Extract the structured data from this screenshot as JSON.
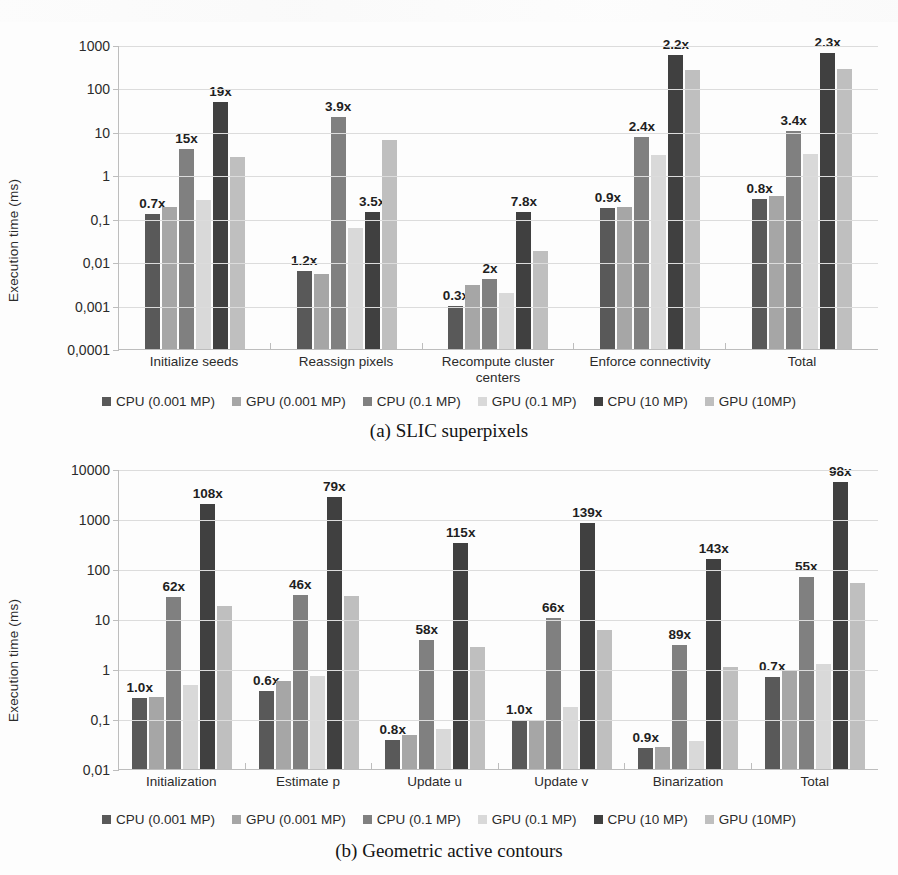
{
  "figures": [
    {
      "id": "fig-a",
      "caption": "(a) SLIC superpixels",
      "chart_data": {
        "type": "bar",
        "title": "",
        "xlabel": "",
        "ylabel": "Execution time (ms)",
        "yscale": "log",
        "ylim": [
          0.0001,
          1000
        ],
        "ytick_labels": [
          "1000",
          "100",
          "10",
          "1",
          "0,1",
          "0,01",
          "0,001",
          "0,0001"
        ],
        "ytick_values": [
          1000,
          100,
          10,
          1,
          0.1,
          0.01,
          0.001,
          0.0001
        ],
        "grid": true,
        "legend_position": "bottom",
        "categories": [
          "Initialize seeds",
          "Reassign pixels",
          "Recompute cluster centers",
          "Enforce connectivity",
          "Total"
        ],
        "series": [
          {
            "name": "CPU (0.001 MP)",
            "color": "#595959",
            "values": [
              0.13,
              0.0063,
              0.001,
              0.18,
              0.28
            ]
          },
          {
            "name": "GPU (0.001 MP)",
            "color": "#a6a6a6",
            "values": [
              0.19,
              0.0053,
              0.003,
              0.19,
              0.33
            ]
          },
          {
            "name": "CPU (0.1 MP)",
            "color": "#808080",
            "values": [
              4.0,
              22.0,
              0.004,
              7.5,
              10.5
            ]
          },
          {
            "name": "GPU (0.1 MP)",
            "color": "#d9d9d9",
            "values": [
              0.27,
              0.062,
              0.002,
              3.0,
              3.1
            ]
          },
          {
            "name": "CPU (10 MP)",
            "color": "#404040",
            "values": [
              48.0,
              0.14,
              0.14,
              600.0,
              640.0
            ]
          },
          {
            "name": "GPU (10MP)",
            "color": "#bfbfbf",
            "values": [
              2.6,
              6.5,
              0.018,
              270.0,
              280.0
            ]
          }
        ],
        "annotations": [
          {
            "category": "Initialize seeds",
            "labels": [
              {
                "text": "0.7x",
                "series": "CPU (0.001 MP)"
              },
              {
                "text": "15x",
                "series": "CPU (0.1 MP)"
              },
              {
                "text": "19x",
                "series": "CPU (10 MP)"
              }
            ]
          },
          {
            "category": "Reassign pixels",
            "labels": [
              {
                "text": "1.2x",
                "series": "CPU (0.001 MP)"
              },
              {
                "text": "3.9x",
                "series": "CPU (0.1 MP)"
              },
              {
                "text": "3.5x",
                "series": "CPU (10 MP)"
              }
            ]
          },
          {
            "category": "Recompute cluster centers",
            "labels": [
              {
                "text": "0.3x",
                "series": "CPU (0.001 MP)"
              },
              {
                "text": "2x",
                "series": "CPU (0.1 MP)"
              },
              {
                "text": "7.8x",
                "series": "CPU (10 MP)"
              }
            ]
          },
          {
            "category": "Enforce connectivity",
            "labels": [
              {
                "text": "0.9x",
                "series": "CPU (0.001 MP)"
              },
              {
                "text": "2.4x",
                "series": "CPU (0.1 MP)"
              },
              {
                "text": "2.2x",
                "series": "CPU (10 MP)"
              }
            ]
          },
          {
            "category": "Total",
            "labels": [
              {
                "text": "0.8x",
                "series": "CPU (0.001 MP)"
              },
              {
                "text": "3.4x",
                "series": "CPU (0.1 MP)"
              },
              {
                "text": "2.3x",
                "series": "CPU (10 MP)"
              }
            ]
          }
        ]
      }
    },
    {
      "id": "fig-b",
      "caption": "(b) Geometric active contours",
      "chart_data": {
        "type": "bar",
        "title": "",
        "xlabel": "",
        "ylabel": "Execution time (ms)",
        "yscale": "log",
        "ylim": [
          0.01,
          10000
        ],
        "ytick_labels": [
          "10000",
          "1000",
          "100",
          "10",
          "1",
          "0,1",
          "0,01"
        ],
        "ytick_values": [
          10000,
          1000,
          100,
          10,
          1,
          0.1,
          0.01
        ],
        "grid": true,
        "legend_position": "bottom",
        "categories": [
          "Initialization",
          "Estimate p",
          "Update u",
          "Update v",
          "Binarization",
          "Total"
        ],
        "series": [
          {
            "name": "CPU (0.001 MP)",
            "color": "#595959",
            "values": [
              0.26,
              0.36,
              0.038,
              0.095,
              0.026,
              0.7
            ]
          },
          {
            "name": "GPU (0.001 MP)",
            "color": "#a6a6a6",
            "values": [
              0.27,
              0.57,
              0.048,
              0.095,
              0.028,
              0.95
            ]
          },
          {
            "name": "CPU (0.1 MP)",
            "color": "#808080",
            "values": [
              28.0,
              30.0,
              3.8,
              10.5,
              3.0,
              70.0
            ]
          },
          {
            "name": "GPU (0.1 MP)",
            "color": "#d9d9d9",
            "values": [
              0.48,
              0.72,
              0.062,
              0.17,
              0.036,
              1.25
            ]
          },
          {
            "name": "CPU (10 MP)",
            "color": "#404040",
            "values": [
              2000.0,
              2800.0,
              330.0,
              850.0,
              160.0,
              5500.0
            ]
          },
          {
            "name": "GPU (10MP)",
            "color": "#bfbfbf",
            "values": [
              18.0,
              29.0,
              2.8,
              6.0,
              1.1,
              52.0
            ]
          }
        ],
        "annotations": [
          {
            "category": "Initialization",
            "labels": [
              {
                "text": "1.0x",
                "series": "CPU (0.001 MP)"
              },
              {
                "text": "62x",
                "series": "CPU (0.1 MP)"
              },
              {
                "text": "108x",
                "series": "CPU (10 MP)"
              }
            ]
          },
          {
            "category": "Estimate p",
            "labels": [
              {
                "text": "0.6x",
                "series": "CPU (0.001 MP)"
              },
              {
                "text": "46x",
                "series": "CPU (0.1 MP)"
              },
              {
                "text": "79x",
                "series": "CPU (10 MP)"
              }
            ]
          },
          {
            "category": "Update u",
            "labels": [
              {
                "text": "0.8x",
                "series": "CPU (0.001 MP)"
              },
              {
                "text": "58x",
                "series": "CPU (0.1 MP)"
              },
              {
                "text": "115x",
                "series": "CPU (10 MP)"
              }
            ]
          },
          {
            "category": "Update v",
            "labels": [
              {
                "text": "1.0x",
                "series": "CPU (0.001 MP)"
              },
              {
                "text": "66x",
                "series": "CPU (0.1 MP)"
              },
              {
                "text": "139x",
                "series": "CPU (10 MP)"
              }
            ]
          },
          {
            "category": "Binarization",
            "labels": [
              {
                "text": "0.9x",
                "series": "CPU (0.001 MP)"
              },
              {
                "text": "89x",
                "series": "CPU (0.1 MP)"
              },
              {
                "text": "143x",
                "series": "CPU (10 MP)"
              }
            ]
          },
          {
            "category": "Total",
            "labels": [
              {
                "text": "0.7x",
                "series": "CPU (0.001 MP)"
              },
              {
                "text": "55x",
                "series": "CPU (0.1 MP)"
              },
              {
                "text": "98x",
                "series": "CPU (10 MP)"
              }
            ]
          }
        ]
      }
    }
  ]
}
